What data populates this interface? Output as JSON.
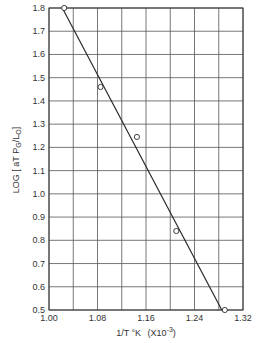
{
  "chart_data": {
    "type": "scatter",
    "title": "",
    "xlabel": "1/T °K (X10⁻³)",
    "xlabel_main": "1/T °K",
    "xlabel_scale": "(X10",
    "xlabel_exp": "-3",
    "xlabel_close": ")",
    "ylabel": "LOG [ aT P_G / L_0 ]",
    "xlim": [
      1.0,
      1.32
    ],
    "ylim": [
      0.5,
      1.8
    ],
    "x_ticks": [
      "1.00",
      "1.08",
      "1.16",
      "1.24",
      "1.32"
    ],
    "x_tick_values": [
      1.0,
      1.08,
      1.16,
      1.24,
      1.32
    ],
    "x_grid_step": 0.04,
    "y_ticks": [
      "1.8",
      "1.7",
      "1.6",
      "1.5",
      "1.4",
      "1.3",
      "1.2",
      "1.1",
      "1.0",
      "0.9",
      "0.8",
      "0.7",
      "0.6",
      "0.5"
    ],
    "y_tick_values": [
      1.8,
      1.7,
      1.6,
      1.5,
      1.4,
      1.3,
      1.2,
      1.1,
      1.0,
      0.9,
      0.8,
      0.7,
      0.6,
      0.5
    ],
    "grid": true,
    "legend": null,
    "series": [
      {
        "name": "data",
        "marker": "open-circle",
        "x": [
          1.025,
          1.085,
          1.145,
          1.21,
          1.29
        ],
        "y": [
          1.8,
          1.46,
          1.245,
          0.84,
          0.5
        ]
      },
      {
        "name": "fit line",
        "type": "line",
        "x": [
          1.022,
          1.285
        ],
        "y": [
          1.8,
          0.5
        ]
      }
    ]
  },
  "colors": {
    "ink": "#2a2a2a",
    "grid": "#555555",
    "background": "#ffffff"
  }
}
